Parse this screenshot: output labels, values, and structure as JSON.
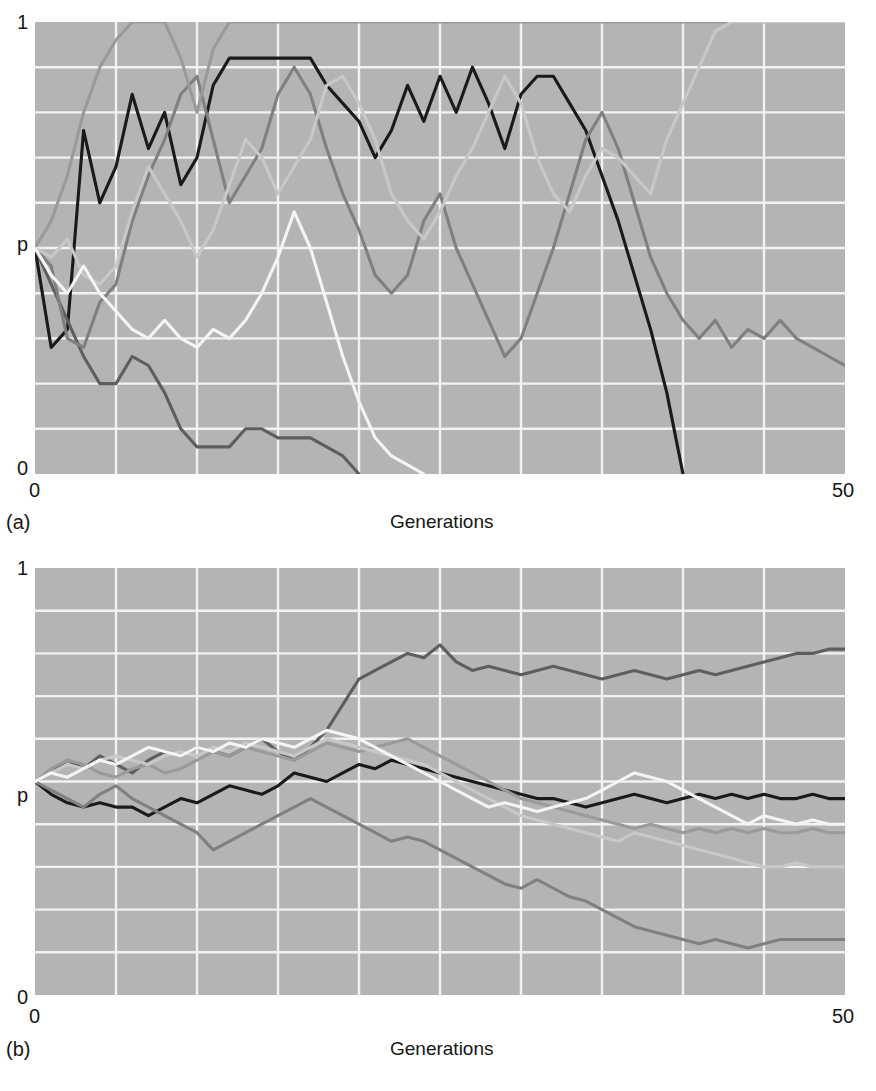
{
  "figure": {
    "panels": [
      {
        "id": "a",
        "letter_label": "(a)",
        "x_axis_title": "Generations",
        "y_ticks": [
          "1",
          "p",
          "0"
        ],
        "x_ticks": [
          "0",
          "50"
        ]
      },
      {
        "id": "b",
        "letter_label": "(b)",
        "x_axis_title": "Generations",
        "y_ticks": [
          "1",
          "p",
          "0"
        ],
        "x_ticks": [
          "0",
          "50"
        ]
      }
    ],
    "colors": {
      "plot_background": "#b4b4b4",
      "gridline": "#f2f2f2",
      "page_background": "#ffffff",
      "text": "#161616",
      "series_black": "#1a1a1a",
      "series_dark_gray": "#5e5e5e",
      "series_medium_gray": "#808080",
      "series_gray": "#9a9a9a",
      "series_light_gray": "#c8c8c8",
      "series_white": "#f4f4f4"
    }
  },
  "chart_data": [
    {
      "type": "line",
      "panel": "a",
      "title": "",
      "subtitle": "",
      "xlabel": "Generations",
      "ylabel": "p",
      "xlim": [
        0,
        50
      ],
      "ylim": [
        0,
        1
      ],
      "xticks": [
        0,
        50
      ],
      "yticks": [
        0,
        0.5,
        1
      ],
      "ytick_labels": [
        "0",
        "p",
        "1"
      ],
      "grid": true,
      "grid_x_step": 5,
      "grid_y_step": 0.1,
      "legend": "none",
      "annotation": "Genetic drift in small populations: allele frequency p fluctuates widely; several populations fix at p=0 or p=1 within 50 generations.",
      "x": [
        0,
        1,
        2,
        3,
        4,
        5,
        6,
        7,
        8,
        9,
        10,
        11,
        12,
        13,
        14,
        15,
        16,
        17,
        18,
        19,
        20,
        21,
        22,
        23,
        24,
        25,
        26,
        27,
        28,
        29,
        30,
        31,
        32,
        33,
        34,
        35,
        36,
        37,
        38,
        39,
        40,
        41,
        42,
        43,
        44,
        45,
        46,
        47,
        48,
        49,
        50
      ],
      "series": [
        {
          "name": "population-1",
          "color": "#1a1a1a",
          "values": [
            0.5,
            0.28,
            0.32,
            0.76,
            0.6,
            0.68,
            0.84,
            0.72,
            0.8,
            0.64,
            0.7,
            0.86,
            0.92,
            0.92,
            0.92,
            0.92,
            0.92,
            0.92,
            0.86,
            0.82,
            0.78,
            0.7,
            0.76,
            0.86,
            0.78,
            0.88,
            0.8,
            0.9,
            0.82,
            0.72,
            0.84,
            0.88,
            0.88,
            0.82,
            0.76,
            0.66,
            0.56,
            0.44,
            0.32,
            0.18,
            0.0,
            null,
            null,
            null,
            null,
            null,
            null,
            null,
            null,
            null,
            null
          ]
        },
        {
          "name": "population-2",
          "color": "#5e5e5e",
          "values": [
            0.5,
            0.42,
            0.34,
            0.26,
            0.2,
            0.2,
            0.26,
            0.24,
            0.18,
            0.1,
            0.06,
            0.06,
            0.06,
            0.1,
            0.1,
            0.08,
            0.08,
            0.08,
            0.06,
            0.04,
            0.0,
            null,
            null,
            null,
            null,
            null,
            null,
            null,
            null,
            null,
            null,
            null,
            null,
            null,
            null,
            null,
            null,
            null,
            null,
            null,
            null,
            null,
            null,
            null,
            null,
            null,
            null,
            null,
            null,
            null,
            null
          ]
        },
        {
          "name": "population-3",
          "color": "#808080",
          "values": [
            0.5,
            0.46,
            0.3,
            0.28,
            0.38,
            0.42,
            0.56,
            0.66,
            0.74,
            0.84,
            0.88,
            0.74,
            0.6,
            0.66,
            0.72,
            0.84,
            0.9,
            0.84,
            0.72,
            0.62,
            0.54,
            0.44,
            0.4,
            0.44,
            0.56,
            0.62,
            0.5,
            0.42,
            0.34,
            0.26,
            0.3,
            0.4,
            0.5,
            0.62,
            0.74,
            0.8,
            0.72,
            0.6,
            0.48,
            0.4,
            0.34,
            0.3,
            0.34,
            0.28,
            0.32,
            0.3,
            0.34,
            0.3,
            0.28,
            0.26,
            0.24
          ]
        },
        {
          "name": "population-4",
          "color": "#9a9a9a",
          "values": [
            0.5,
            0.56,
            0.66,
            0.8,
            0.9,
            0.96,
            1.0,
            1.0,
            1.0,
            0.92,
            0.8,
            0.94,
            1.0,
            1.0,
            1.0,
            1.0,
            1.0,
            1.0,
            1.0,
            1.0,
            1.0,
            1.0,
            1.0,
            1.0,
            1.0,
            1.0,
            1.0,
            1.0,
            1.0,
            1.0,
            1.0,
            1.0,
            1.0,
            1.0,
            1.0,
            1.0,
            1.0,
            1.0,
            1.0,
            1.0,
            1.0,
            1.0,
            1.0,
            1.0,
            1.0,
            1.0,
            1.0,
            1.0,
            1.0,
            1.0,
            1.0
          ]
        },
        {
          "name": "population-5",
          "color": "#c8c8c8",
          "values": [
            0.5,
            0.48,
            0.52,
            0.44,
            0.42,
            0.46,
            0.58,
            0.68,
            0.62,
            0.56,
            0.48,
            0.54,
            0.64,
            0.74,
            0.7,
            0.62,
            0.68,
            0.74,
            0.86,
            0.88,
            0.82,
            0.74,
            0.62,
            0.56,
            0.52,
            0.58,
            0.66,
            0.72,
            0.8,
            0.88,
            0.82,
            0.7,
            0.62,
            0.58,
            0.66,
            0.72,
            0.7,
            0.66,
            0.62,
            0.74,
            0.82,
            0.9,
            0.98,
            1.0,
            1.0,
            1.0,
            1.0,
            1.0,
            1.0,
            1.0,
            1.0
          ]
        },
        {
          "name": "population-6",
          "color": "#f4f4f4",
          "values": [
            0.5,
            0.44,
            0.4,
            0.46,
            0.4,
            0.36,
            0.32,
            0.3,
            0.34,
            0.3,
            0.28,
            0.32,
            0.3,
            0.34,
            0.4,
            0.48,
            0.58,
            0.5,
            0.38,
            0.26,
            0.16,
            0.08,
            0.04,
            0.02,
            0.0,
            null,
            null,
            null,
            null,
            null,
            null,
            null,
            null,
            null,
            null,
            null,
            null,
            null,
            null,
            null,
            null,
            null,
            null,
            null,
            null,
            null,
            null,
            null,
            null,
            null,
            null
          ]
        }
      ]
    },
    {
      "type": "line",
      "panel": "b",
      "title": "",
      "subtitle": "",
      "xlabel": "Generations",
      "ylabel": "p",
      "xlim": [
        0,
        50
      ],
      "ylim": [
        0,
        1
      ],
      "xticks": [
        0,
        50
      ],
      "yticks": [
        0,
        0.5,
        1
      ],
      "ytick_labels": [
        "0",
        "p",
        "1"
      ],
      "grid": true,
      "grid_x_step": 5,
      "grid_y_step": 0.1,
      "legend": "none",
      "annotation": "Genetic drift in large populations: allele frequency p drifts only gradually; no population fixes within 50 generations.",
      "x": [
        0,
        1,
        2,
        3,
        4,
        5,
        6,
        7,
        8,
        9,
        10,
        11,
        12,
        13,
        14,
        15,
        16,
        17,
        18,
        19,
        20,
        21,
        22,
        23,
        24,
        25,
        26,
        27,
        28,
        29,
        30,
        31,
        32,
        33,
        34,
        35,
        36,
        37,
        38,
        39,
        40,
        41,
        42,
        43,
        44,
        45,
        46,
        47,
        48,
        49,
        50
      ],
      "series": [
        {
          "name": "population-1",
          "color": "#1a1a1a",
          "values": [
            0.5,
            0.47,
            0.45,
            0.44,
            0.45,
            0.44,
            0.44,
            0.42,
            0.44,
            0.46,
            0.45,
            0.47,
            0.49,
            0.48,
            0.47,
            0.49,
            0.52,
            0.51,
            0.5,
            0.52,
            0.54,
            0.53,
            0.55,
            0.54,
            0.53,
            0.52,
            0.51,
            0.5,
            0.49,
            0.48,
            0.47,
            0.46,
            0.46,
            0.45,
            0.44,
            0.45,
            0.46,
            0.47,
            0.46,
            0.45,
            0.46,
            0.47,
            0.46,
            0.47,
            0.46,
            0.47,
            0.46,
            0.46,
            0.47,
            0.46,
            0.46
          ]
        },
        {
          "name": "population-2",
          "color": "#5e5e5e",
          "values": [
            0.5,
            0.52,
            0.55,
            0.53,
            0.56,
            0.54,
            0.52,
            0.55,
            0.57,
            0.56,
            0.58,
            0.57,
            0.56,
            0.58,
            0.6,
            0.57,
            0.55,
            0.58,
            0.62,
            0.68,
            0.74,
            0.76,
            0.78,
            0.8,
            0.79,
            0.82,
            0.78,
            0.76,
            0.77,
            0.76,
            0.75,
            0.76,
            0.77,
            0.76,
            0.75,
            0.74,
            0.75,
            0.76,
            0.75,
            0.74,
            0.75,
            0.76,
            0.75,
            0.76,
            0.77,
            0.78,
            0.79,
            0.8,
            0.8,
            0.81,
            0.81
          ]
        },
        {
          "name": "population-3",
          "color": "#808080",
          "values": [
            0.5,
            0.48,
            0.46,
            0.44,
            0.47,
            0.49,
            0.46,
            0.44,
            0.42,
            0.4,
            0.38,
            0.34,
            0.36,
            0.38,
            0.4,
            0.42,
            0.44,
            0.46,
            0.44,
            0.42,
            0.4,
            0.38,
            0.36,
            0.37,
            0.36,
            0.34,
            0.32,
            0.3,
            0.28,
            0.26,
            0.25,
            0.27,
            0.25,
            0.23,
            0.22,
            0.2,
            0.18,
            0.16,
            0.15,
            0.14,
            0.13,
            0.12,
            0.13,
            0.12,
            0.11,
            0.12,
            0.13,
            0.13,
            0.13,
            0.13,
            0.13
          ]
        },
        {
          "name": "population-4",
          "color": "#9a9a9a",
          "values": [
            0.5,
            0.53,
            0.55,
            0.54,
            0.52,
            0.51,
            0.53,
            0.54,
            0.52,
            0.53,
            0.55,
            0.57,
            0.56,
            0.58,
            0.57,
            0.56,
            0.55,
            0.57,
            0.59,
            0.58,
            0.57,
            0.58,
            0.59,
            0.6,
            0.58,
            0.56,
            0.54,
            0.52,
            0.5,
            0.48,
            0.46,
            0.45,
            0.44,
            0.43,
            0.42,
            0.41,
            0.4,
            0.39,
            0.4,
            0.39,
            0.38,
            0.39,
            0.38,
            0.39,
            0.38,
            0.39,
            0.38,
            0.38,
            0.39,
            0.38,
            0.38
          ]
        },
        {
          "name": "population-5",
          "color": "#c8c8c8",
          "values": [
            0.5,
            0.52,
            0.54,
            0.53,
            0.55,
            0.56,
            0.55,
            0.54,
            0.56,
            0.57,
            0.56,
            0.58,
            0.57,
            0.59,
            0.58,
            0.57,
            0.56,
            0.58,
            0.6,
            0.59,
            0.58,
            0.57,
            0.56,
            0.55,
            0.54,
            0.52,
            0.5,
            0.48,
            0.46,
            0.44,
            0.42,
            0.41,
            0.4,
            0.39,
            0.38,
            0.37,
            0.36,
            0.38,
            0.37,
            0.36,
            0.35,
            0.34,
            0.33,
            0.32,
            0.31,
            0.3,
            0.3,
            0.31,
            0.3,
            0.3,
            0.3
          ]
        },
        {
          "name": "population-6",
          "color": "#f4f4f4",
          "values": [
            0.5,
            0.52,
            0.51,
            0.53,
            0.55,
            0.54,
            0.56,
            0.58,
            0.57,
            0.56,
            0.58,
            0.57,
            0.59,
            0.58,
            0.6,
            0.59,
            0.58,
            0.6,
            0.62,
            0.61,
            0.6,
            0.58,
            0.56,
            0.54,
            0.52,
            0.5,
            0.48,
            0.46,
            0.44,
            0.45,
            0.44,
            0.43,
            0.44,
            0.45,
            0.46,
            0.48,
            0.5,
            0.52,
            0.51,
            0.5,
            0.48,
            0.46,
            0.44,
            0.42,
            0.4,
            0.42,
            0.41,
            0.4,
            0.41,
            0.4,
            0.4
          ]
        }
      ]
    }
  ]
}
